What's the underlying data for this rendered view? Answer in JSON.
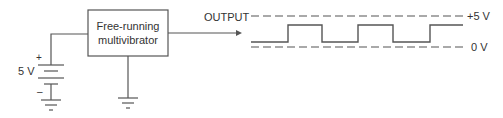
{
  "block": {
    "line1": "Free-running",
    "line2": "multivibrator"
  },
  "battery": {
    "voltage": "5 V",
    "plus": "+",
    "minus": "–"
  },
  "output": {
    "label": "OUTPUT"
  },
  "waveform": {
    "high_label": "+5 V",
    "low_label": "0 V"
  },
  "colors": {
    "line": "#555555",
    "text": "#333333"
  }
}
